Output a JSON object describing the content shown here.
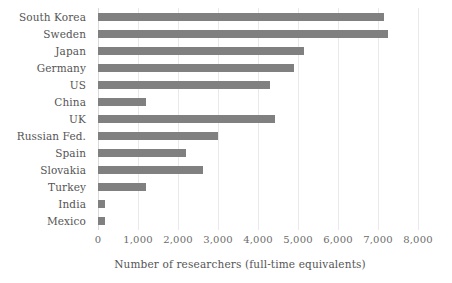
{
  "chart_data": {
    "type": "bar",
    "orientation": "horizontal",
    "title": "",
    "xlabel": "Number of researchers (full-time equivalents)",
    "ylabel": "",
    "categories": [
      "South Korea",
      "Sweden",
      "Japan",
      "Germany",
      "US",
      "China",
      "UK",
      "Russian Fed.",
      "Spain",
      "Slovakia",
      "Turkey",
      "India",
      "Mexico"
    ],
    "values": [
      7150,
      7250,
      5150,
      4900,
      4300,
      1200,
      4420,
      3000,
      2200,
      2620,
      1200,
      180,
      180
    ],
    "xlim": [
      0,
      8000
    ],
    "xticks": [
      0,
      1000,
      2000,
      3000,
      4000,
      5000,
      6000,
      7000,
      8000
    ],
    "xtick_labels": [
      "0",
      "1,000",
      "2,000",
      "3,000",
      "4,000",
      "5,000",
      "6,000",
      "7,000",
      "8,000"
    ],
    "grid": true,
    "grid_axis": "x",
    "legend": false,
    "bar_color": "#808080",
    "gridline_color": "#e9e9e9",
    "text_color": "#555555"
  }
}
